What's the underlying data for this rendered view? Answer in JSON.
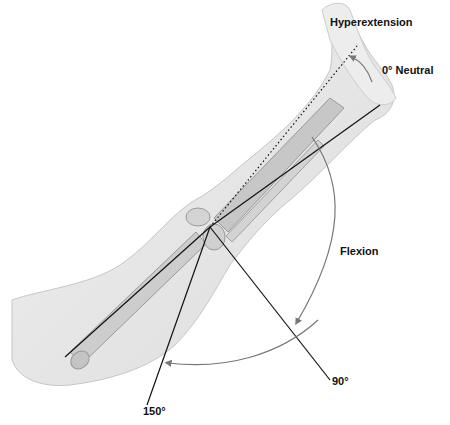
{
  "diagram": {
    "labels": {
      "hyperextension": "Hyperextension",
      "neutral": "0° Neutral",
      "flexion": "Flexion",
      "deg90": "90°",
      "deg150": "150°"
    },
    "colors": {
      "skin": "#e6e6e6",
      "skin_edge": "#c4c4c4",
      "bone": "#c9c9c9",
      "bone_edge": "#8f8f8f",
      "line": "#111111",
      "arc": "#666666"
    },
    "angles": [
      "Hyperextension",
      "0° Neutral",
      "90°",
      "150°"
    ]
  }
}
